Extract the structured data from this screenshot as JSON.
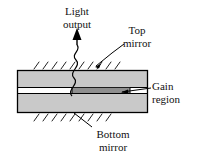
{
  "figure": {
    "type": "schematic-diagram",
    "background_color": "#ffffff",
    "line_color": "#000000"
  },
  "labels": {
    "light_output": {
      "line1": "Light",
      "line2": "output"
    },
    "top_mirror": {
      "line1": "Top",
      "line2": "mirror"
    },
    "gain_region": {
      "line1": "Gain",
      "line2": "region"
    },
    "bottom_mirror": {
      "line1": "Bottom",
      "line2": "mirror"
    }
  },
  "parts": {
    "slab_fill": "#c9c9c9",
    "slab_stroke": "#000000",
    "cavity_gap_fill": "#ffffff",
    "gain_region_fill": "#8f8f8f",
    "hatch_color": "#222222",
    "ray_color": "#000000"
  },
  "geometry": {
    "slab": {
      "x": 17,
      "y": 70,
      "width": 131,
      "height": 43
    },
    "cavity_layer": {
      "x": 17,
      "y": 87,
      "width": 131,
      "height": 7
    },
    "gain_region": {
      "x": 72,
      "y": 87,
      "width": 58,
      "height": 7
    },
    "top_hatch_count": 8,
    "bottom_hatch_count": 8
  }
}
